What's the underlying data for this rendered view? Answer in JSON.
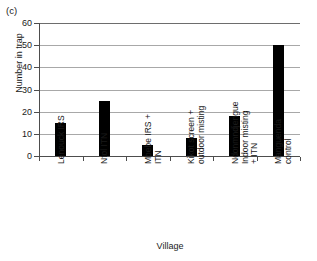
{
  "figure": {
    "panel_label": "(c)",
    "xlabel": "Village",
    "ylabel": "Number in trap"
  },
  "chart_data": {
    "type": "bar",
    "title": "",
    "panel": "(c)",
    "xlabel": "Village",
    "ylabel": "Number in trap",
    "ylim": [
      0,
      60
    ],
    "yticks": [
      0,
      10,
      20,
      30,
      40,
      50,
      60
    ],
    "grid": true,
    "legend": false,
    "bar_color": "#000000",
    "categories": [
      "Lenouck IRS",
      "Ntol ITN",
      "Mbebe IRS + ITN",
      "Kikot screen + outdoor misting",
      "Ndonmndjengue Indoor misting + ITN",
      "Manguenda control"
    ],
    "tick_labels": [
      "Lenouck IRS",
      "Ntol ITN",
      "Mbebe IRS +\nITN",
      "Kikot screen +\noutdoor misting",
      "Ndonmndjengue\nIndoor misting\n+ ITN",
      "Manguenda\ncontrol"
    ],
    "values": [
      15,
      25,
      5,
      8,
      18,
      50
    ]
  }
}
